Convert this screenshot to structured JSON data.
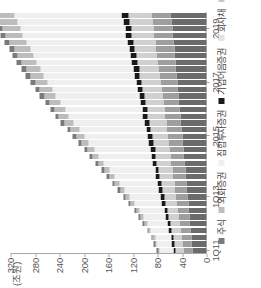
{
  "chart_data": {
    "type": "bar",
    "stacked": true,
    "title": "",
    "xlabel": "",
    "ylabel": "(조원)",
    "unit_label": "(조원)",
    "ylim": [
      0,
      320
    ],
    "yticks": [
      0,
      40,
      80,
      120,
      160,
      200,
      240,
      280,
      320
    ],
    "ytick_labels": [
      "0",
      "40",
      "80",
      "120",
      "160",
      "200",
      "240",
      "280",
      "320"
    ],
    "grid": false,
    "legend_position": "bottom-left",
    "orientation": "rotated-90-ccw",
    "categories": [
      "1Q11",
      "2Q11",
      "3Q11",
      "4Q11",
      "1Q12",
      "2Q12",
      "3Q12",
      "4Q12",
      "1Q13",
      "2Q13",
      "3Q13",
      "4Q13",
      "1Q14",
      "2Q14",
      "3Q14",
      "4Q14",
      "1Q15",
      "2Q15",
      "3Q15",
      "4Q15",
      "1Q16",
      "2Q16",
      "3Q16",
      "4Q16",
      "1Q17",
      "2Q17",
      "3Q17",
      "4Q17",
      "1Q18",
      "2Q18",
      "3Q18",
      "4Q18",
      "1Q19",
      "2Q19",
      "3Q19",
      "4Q19"
    ],
    "xtick_labels": [
      "1Q11",
      "1Q13",
      "2015",
      "2017",
      "2019"
    ],
    "xtick_indices": [
      0,
      8,
      17,
      25,
      33
    ],
    "series": [
      {
        "name": "국채 · 지방채",
        "color": "#6b6b6b",
        "values": [
          23,
          24,
          25,
          26,
          27,
          28,
          29,
          30,
          31,
          32,
          33,
          34,
          35,
          36,
          37,
          38,
          39,
          40,
          41,
          42,
          43,
          44,
          45,
          46,
          47,
          48,
          49,
          50,
          51,
          52,
          53,
          54,
          55,
          56,
          57,
          58
        ]
      },
      {
        "name": "특수채",
        "color": "#9e9e9e",
        "values": [
          15,
          16,
          16,
          17,
          17,
          18,
          18,
          19,
          19,
          20,
          20,
          21,
          21,
          22,
          22,
          22,
          23,
          23,
          24,
          24,
          25,
          25,
          26,
          26,
          27,
          27,
          28,
          28,
          29,
          29,
          30,
          30,
          31,
          31,
          32,
          32
        ]
      },
      {
        "name": "회사채",
        "color": "#d0d0d0",
        "values": [
          12,
          13,
          13,
          14,
          15,
          16,
          17,
          18,
          19,
          20,
          21,
          22,
          22,
          23,
          24,
          24,
          25,
          26,
          26,
          27,
          28,
          28,
          29,
          30,
          30,
          31,
          32,
          32,
          33,
          34,
          34,
          35,
          36,
          36,
          37,
          38
        ]
      },
      {
        "name": "기업어음증권",
        "color": "#1a1a1a",
        "values": [
          4,
          4,
          4,
          5,
          5,
          5,
          5,
          6,
          6,
          6,
          6,
          6,
          6,
          7,
          7,
          7,
          7,
          7,
          7,
          8,
          8,
          8,
          8,
          8,
          8,
          9,
          9,
          9,
          9,
          9,
          9,
          10,
          10,
          10,
          10,
          10
        ]
      },
      {
        "name": "집합투자증권",
        "color": "#efefef",
        "values": [
          22,
          24,
          26,
          29,
          32,
          36,
          40,
          45,
          50,
          56,
          62,
          68,
          74,
          80,
          86,
          92,
          98,
          104,
          110,
          116,
          121,
          126,
          131,
          136,
          140,
          144,
          148,
          152,
          156,
          159,
          162,
          165,
          168,
          171,
          173,
          175
        ]
      },
      {
        "name": "외화증권",
        "color": "#bdbdbd",
        "values": [
          3,
          3,
          4,
          4,
          5,
          5,
          6,
          6,
          7,
          7,
          8,
          8,
          9,
          9,
          10,
          11,
          12,
          13,
          14,
          15,
          16,
          17,
          18,
          19,
          20,
          21,
          22,
          23,
          24,
          25,
          26,
          27,
          28,
          29,
          30,
          31
        ]
      },
      {
        "name": "주식",
        "color": "#7a7a7a",
        "values": [
          2,
          2,
          2,
          2,
          3,
          3,
          3,
          3,
          3,
          4,
          4,
          4,
          4,
          4,
          5,
          5,
          5,
          5,
          5,
          6,
          6,
          6,
          6,
          7,
          7,
          7,
          7,
          8,
          8,
          8,
          8,
          9,
          9,
          9,
          9,
          9
        ]
      }
    ],
    "marker_series": {
      "name": "기업어음증권-marker",
      "color": "#1a1a1a"
    }
  },
  "legend": {
    "items": [
      {
        "label": "주식",
        "color": "#7a7a7a"
      },
      {
        "label": "외화증권",
        "color": "#bdbdbd"
      },
      {
        "label": "집합투자증권",
        "color": "#efefef"
      },
      {
        "label": "기업어음증권",
        "color": "#1a1a1a"
      },
      {
        "label": "회사채",
        "color": "#e4e4e4"
      },
      {
        "label": "특수채",
        "color": "#c9c9c9"
      },
      {
        "label": "국채 · 지방채",
        "color": "#6b6b6b"
      }
    ]
  }
}
